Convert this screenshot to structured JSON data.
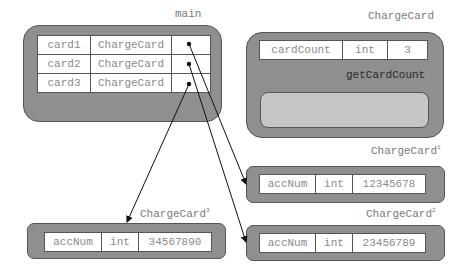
{
  "main": {
    "title": "main",
    "rows": [
      {
        "name": "card1",
        "type": "ChargeCard"
      },
      {
        "name": "card2",
        "type": "ChargeCard"
      },
      {
        "name": "card3",
        "type": "ChargeCard"
      }
    ]
  },
  "class_box": {
    "title": "ChargeCard",
    "field": {
      "name": "cardCount",
      "type": "int",
      "value": "3"
    },
    "method": "getCardCount"
  },
  "objects": [
    {
      "title": "ChargeCard",
      "sup": "1",
      "field": {
        "name": "accNum",
        "type": "int",
        "value": "12345678"
      }
    },
    {
      "title": "ChargeCard",
      "sup": "2",
      "field": {
        "name": "accNum",
        "type": "int",
        "value": "23456789"
      }
    },
    {
      "title": "ChargeCard",
      "sup": "3",
      "field": {
        "name": "accNum",
        "type": "int",
        "value": "34567890"
      }
    }
  ],
  "colors": {
    "frame": "#8f8f8f",
    "method_body": "#c6c6c6",
    "border": "#555555",
    "text": "#7a7a7a"
  }
}
